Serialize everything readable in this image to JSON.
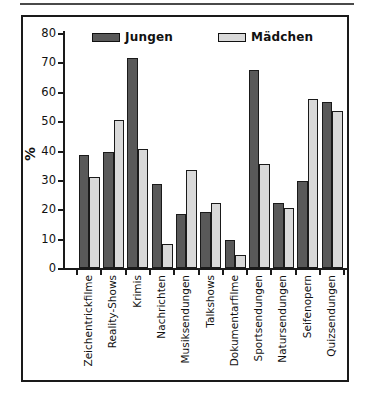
{
  "chart_data": {
    "type": "bar",
    "title": "",
    "ylabel": "%",
    "xlabel": "",
    "ylim": [
      0,
      80
    ],
    "yticks": [
      0,
      10,
      20,
      30,
      40,
      50,
      60,
      70,
      80
    ],
    "grid": false,
    "legend_position": "top-inside",
    "categories": [
      "Zeichentrickfilme",
      "Reality-Shows",
      "Krimis",
      "Nachrichten",
      "Musiksendungen",
      "Talkshows",
      "Dokumentarfilme",
      "Sportsendungen",
      "Natursendungen",
      "Seifenopern",
      "Quizsendungen"
    ],
    "series": [
      {
        "name": "Jungen",
        "color": "#595959",
        "values": [
          38.5,
          39.5,
          71.5,
          28.5,
          18.5,
          19,
          9.5,
          67.5,
          22,
          29.5,
          56.5
        ]
      },
      {
        "name": "Mädchen",
        "color": "#d9d9d9",
        "values": [
          31,
          50.5,
          40.5,
          8,
          33.5,
          22,
          4.5,
          35.5,
          20.5,
          57.5,
          53.5
        ]
      }
    ],
    "colors": {
      "axis": "#1a1a1a",
      "bar_border": "#1a1a1a",
      "frame_border": "#1a1a1a",
      "background": "#ffffff",
      "text": "#111111"
    }
  }
}
